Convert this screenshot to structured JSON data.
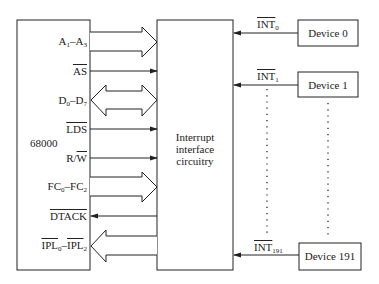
{
  "diagram": {
    "cpu": {
      "label": "68000"
    },
    "interface": {
      "lines": [
        "Interrupt",
        "interface",
        "circuitry"
      ]
    },
    "signals": [
      {
        "name": "A",
        "from": "1",
        "to": "A",
        "to_sub": "3",
        "type": "bus",
        "direction": "to-interface",
        "overline": false
      },
      {
        "name": "AS",
        "type": "line",
        "direction": "to-interface",
        "overline": true
      },
      {
        "name": "D",
        "from": "0",
        "to": "D",
        "to_sub": "7",
        "type": "bus",
        "direction": "bidirectional",
        "overline": false
      },
      {
        "name": "LDS",
        "type": "line",
        "direction": "to-interface",
        "overline": true
      },
      {
        "name": "R/W",
        "type": "line",
        "direction": "to-interface",
        "overline": "W only"
      },
      {
        "name": "FC",
        "from": "0",
        "to": "FC",
        "to_sub": "2",
        "type": "bus",
        "direction": "to-interface",
        "overline": false
      },
      {
        "name": "DTACK",
        "type": "line",
        "direction": "to-cpu",
        "overline": true
      },
      {
        "name": "IPL",
        "from": "0",
        "to": "IPL",
        "to_sub": "2",
        "type": "bus",
        "direction": "to-cpu",
        "overline": true
      }
    ],
    "labels": {
      "a_main": "A",
      "a_sub1": "1",
      "a_dash": "–A",
      "a_sub2": "3",
      "as": "AS",
      "d_main": "D",
      "d_sub1": "0",
      "d_dash": "–D",
      "d_sub2": "7",
      "lds": "LDS",
      "rw_r": "R/",
      "rw_w": "W",
      "fc_main": "FC",
      "fc_sub1": "0",
      "fc_dash": "–FC",
      "fc_sub2": "2",
      "dtack": "DTACK",
      "ipl_main1": "IPL",
      "ipl_sub1": "0",
      "ipl_dash": "–",
      "ipl_main2": "IPL",
      "ipl_sub2": "2"
    },
    "devices": [
      {
        "label": "Device 0",
        "int_main": "INT",
        "int_sub": "0"
      },
      {
        "label": "Device 1",
        "int_main": "INT",
        "int_sub": "1"
      },
      {
        "label": "Device 191",
        "int_main": "INT",
        "int_sub": "191"
      }
    ]
  }
}
